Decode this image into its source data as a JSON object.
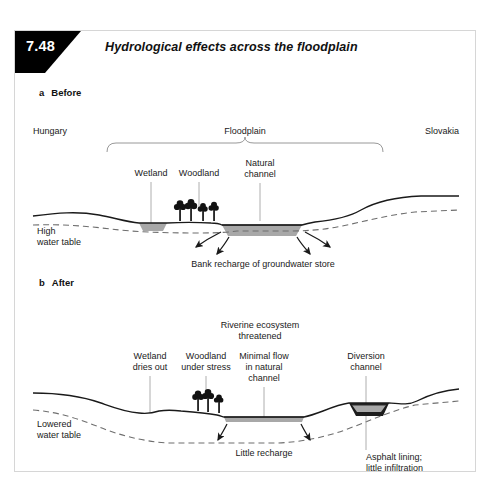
{
  "figure": {
    "number": "7.48",
    "title": "Hydrological effects across the floodplain"
  },
  "panels": [
    {
      "tag": "a",
      "name": "Before",
      "region_labels": {
        "left": "Hungary",
        "center": "Floodplain",
        "right": "Slovakia"
      },
      "feature_labels": [
        {
          "id": "wetland",
          "text": "Wetland"
        },
        {
          "id": "woodland",
          "text": "Woodland"
        },
        {
          "id": "natural-channel-line1",
          "text": "Natural"
        },
        {
          "id": "natural-channel-line2",
          "text": "channel"
        }
      ],
      "water_table_label": {
        "line1": "High",
        "line2": "water table"
      },
      "process_label": "Bank recharge of groundwater store"
    },
    {
      "tag": "b",
      "name": "After",
      "headline": {
        "line1": "Riverine ecosystem",
        "line2": "threatened"
      },
      "feature_labels": [
        {
          "id": "wetland",
          "line1": "Wetland",
          "line2": "dries out"
        },
        {
          "id": "woodland",
          "line1": "Woodland",
          "line2": "under stress"
        },
        {
          "id": "minimal-flow",
          "line1": "Minimal flow",
          "line2": "in natural",
          "line3": "channel"
        },
        {
          "id": "diversion",
          "line1": "Diversion",
          "line2": "channel"
        }
      ],
      "water_table_label": {
        "line1": "Lowered",
        "line2": "water table"
      },
      "process_label": "Little recharge",
      "asphalt_label": {
        "line1": "Asphalt lining;",
        "line2": "little infiltration"
      }
    }
  ],
  "colors": {
    "ink": "#1a1a1a",
    "water": "#a8a8a8",
    "water_table": "#6e6e6e",
    "leader": "#9a9a9a",
    "frame": "#d6d6d6",
    "tab": "#000000"
  }
}
